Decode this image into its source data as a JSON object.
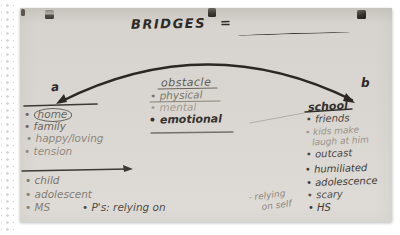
{
  "colors": {
    "paper": "#d8d5d0",
    "ink_dark": "#33302c",
    "pencil_faint": "#9a9388"
  },
  "title": {
    "word": "BRIDGES",
    "equals": "="
  },
  "arc": {
    "label_a": "a",
    "label_b": "b"
  },
  "obstacles": {
    "heading": "obstacle",
    "items": [
      "• physical",
      "• mental",
      "• emotional"
    ]
  },
  "left_top": {
    "home_bullet": "•",
    "items": [
      "home",
      "• family",
      "• happy/loving",
      "• tension"
    ]
  },
  "left_bottom": {
    "items": [
      "• child",
      "• adolescent",
      "• MS"
    ],
    "note": "• P's: relying on"
  },
  "right_column": {
    "heading": "school",
    "items": [
      "• friends",
      "• kids make",
      "laugh at him",
      "• outcast",
      "• humiliated",
      "• adolescence",
      "• scary",
      "• HS"
    ]
  },
  "floating_note": {
    "line1": "- relying",
    "line2": "on self"
  }
}
